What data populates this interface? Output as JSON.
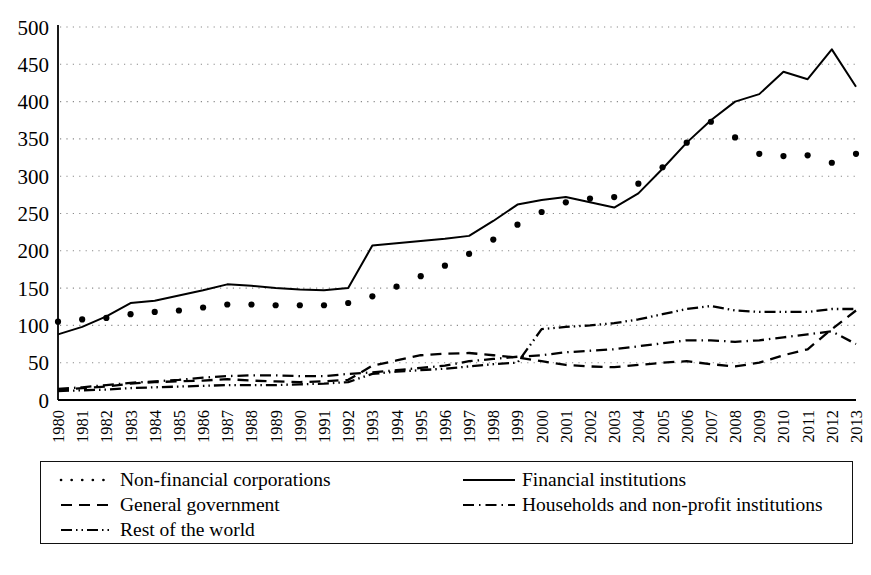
{
  "chart_data": {
    "type": "line",
    "title": "",
    "subtitle": "",
    "xlabel": "",
    "ylabel": "",
    "x": [
      1980,
      1981,
      1982,
      1983,
      1984,
      1985,
      1986,
      1987,
      1988,
      1989,
      1990,
      1991,
      1992,
      1993,
      1994,
      1995,
      1996,
      1997,
      1998,
      1999,
      2000,
      2001,
      2002,
      2003,
      2004,
      2005,
      2006,
      2007,
      2008,
      2009,
      2010,
      2011,
      2012,
      2013
    ],
    "categories": [
      "1980",
      "1981",
      "1982",
      "1983",
      "1984",
      "1985",
      "1986",
      "1987",
      "1988",
      "1989",
      "1990",
      "1991",
      "1992",
      "1993",
      "1994",
      "1995",
      "1996",
      "1997",
      "1998",
      "1999",
      "2000",
      "2001",
      "2002",
      "2003",
      "2004",
      "2005",
      "2006",
      "2007",
      "2008",
      "2009",
      "2010",
      "2011",
      "2012",
      "2013"
    ],
    "xlim": [
      1980,
      2013
    ],
    "ylim": [
      0,
      500
    ],
    "yticks": [
      0,
      50,
      100,
      150,
      200,
      250,
      300,
      350,
      400,
      450,
      500
    ],
    "ytick_labels": [
      "0",
      "50",
      "100",
      "150",
      "200",
      "250",
      "300",
      "350",
      "400",
      "450",
      "500"
    ],
    "grid": true,
    "grid_style": "dotted-horizontal",
    "legend_position": "bottom",
    "series": [
      {
        "name": "Non-financial corporations",
        "style": "dotted",
        "marker": "dot",
        "color": "#000000",
        "values": [
          105,
          108,
          110,
          115,
          118,
          120,
          124,
          128,
          128,
          127,
          127,
          127,
          130,
          139,
          152,
          166,
          180,
          196,
          215,
          235,
          252,
          265,
          270,
          272,
          290,
          312,
          345,
          373,
          352,
          330,
          327,
          328,
          318,
          330
        ]
      },
      {
        "name": "Financial institutions",
        "style": "solid",
        "color": "#000000",
        "values": [
          88,
          98,
          112,
          130,
          133,
          140,
          147,
          155,
          153,
          150,
          148,
          147,
          150,
          207,
          210,
          213,
          216,
          220,
          240,
          262,
          268,
          272,
          265,
          258,
          277,
          310,
          345,
          375,
          400,
          410,
          440,
          430,
          470,
          420
        ]
      },
      {
        "name": "General government",
        "style": "dashed",
        "color": "#000000",
        "values": [
          13,
          16,
          18,
          22,
          24,
          25,
          26,
          28,
          26,
          25,
          24,
          25,
          27,
          46,
          53,
          60,
          62,
          63,
          60,
          57,
          52,
          47,
          45,
          44,
          47,
          50,
          52,
          48,
          45,
          50,
          60,
          68,
          95,
          120
        ]
      },
      {
        "name": "Households and non-profit institutions",
        "style": "dash-dot",
        "color": "#000000",
        "values": [
          15,
          17,
          20,
          23,
          25,
          27,
          30,
          32,
          33,
          33,
          32,
          32,
          35,
          37,
          40,
          43,
          46,
          52,
          55,
          58,
          60,
          64,
          66,
          68,
          72,
          76,
          80,
          80,
          78,
          80,
          84,
          88,
          92,
          75
        ]
      },
      {
        "name": "Rest of the world",
        "style": "dash-dot-dot",
        "color": "#000000",
        "values": [
          12,
          13,
          14,
          16,
          17,
          18,
          19,
          20,
          20,
          20,
          21,
          22,
          24,
          35,
          38,
          40,
          42,
          45,
          48,
          50,
          95,
          98,
          100,
          103,
          108,
          115,
          122,
          126,
          120,
          118,
          118,
          118,
          122,
          122
        ]
      }
    ]
  },
  "legend": {
    "entries": [
      {
        "label": "Non-financial corporations",
        "style": "dotted",
        "position": "left-1"
      },
      {
        "label": "Financial institutions",
        "style": "solid",
        "position": "right-1"
      },
      {
        "label": "General government",
        "style": "dashed",
        "position": "left-2"
      },
      {
        "label": "Households and non-profit institutions",
        "style": "dash-dot",
        "position": "right-2"
      },
      {
        "label": "Rest of the world",
        "style": "dash-dot-dot",
        "position": "left-3"
      }
    ]
  },
  "colors": {
    "ink": "#000000",
    "grid": "#8a8a8a",
    "background": "#ffffff"
  }
}
